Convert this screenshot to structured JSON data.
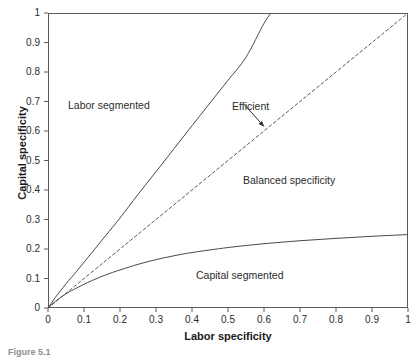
{
  "figure": {
    "caption": "Figure 5.1"
  },
  "axes": {
    "x_title": "Labor specificity",
    "y_title": "Capital specificity",
    "x_ticks": [
      "0",
      "0.1",
      "0.2",
      "0.3",
      "0.4",
      "0.5",
      "0.6",
      "0.7",
      "0.8",
      "0.9",
      "1"
    ],
    "y_ticks": [
      "0",
      "0.1",
      "0.2",
      "0.3",
      "0.4",
      "0.5",
      "0.6",
      "0.7",
      "0.8",
      "0.9",
      "1"
    ]
  },
  "annotations": {
    "labor_segmented": "Labor segmented",
    "balanced_specificity": "Balanced specificity",
    "capital_segmented": "Capital segmented",
    "efficient": "Efficient"
  },
  "colors": {
    "frame": "#5a5a5a",
    "curve": "#4a4a4a",
    "dashed": "#5a5a5a",
    "text": "#2b2b2b"
  },
  "chart_data": {
    "type": "line",
    "title": "",
    "xlabel": "Labor specificity",
    "ylabel": "Capital specificity",
    "xlim": [
      0,
      1
    ],
    "ylim": [
      0,
      1
    ],
    "grid": false,
    "legend": "none",
    "xticks": [
      0,
      0.1,
      0.2,
      0.3,
      0.4,
      0.5,
      0.6,
      0.7,
      0.8,
      0.9,
      1
    ],
    "yticks": [
      0,
      0.1,
      0.2,
      0.3,
      0.4,
      0.5,
      0.6,
      0.7,
      0.8,
      0.9,
      1
    ],
    "series": [
      {
        "name": "Upper boundary (labor segmented / balanced)",
        "style": "solid",
        "x": [
          0,
          0.02,
          0.05,
          0.08,
          0.12,
          0.16,
          0.2,
          0.25,
          0.3,
          0.35,
          0.4,
          0.45,
          0.5,
          0.55,
          0.6,
          0.62
        ],
        "y": [
          0,
          0.035,
          0.082,
          0.125,
          0.185,
          0.245,
          0.305,
          0.385,
          0.462,
          0.54,
          0.618,
          0.695,
          0.772,
          0.85,
          0.965,
          1.0
        ]
      },
      {
        "name": "Efficient (45-degree line)",
        "style": "dashed",
        "x": [
          0,
          1
        ],
        "y": [
          0,
          1
        ]
      },
      {
        "name": "Lower boundary (capital segmented / balanced)",
        "style": "solid",
        "x": [
          0,
          0.02,
          0.05,
          0.08,
          0.12,
          0.16,
          0.2,
          0.25,
          0.3,
          0.35,
          0.4,
          0.5,
          0.6,
          0.7,
          0.8,
          0.9,
          1.0
        ],
        "y": [
          0,
          0.022,
          0.048,
          0.068,
          0.092,
          0.112,
          0.129,
          0.148,
          0.164,
          0.177,
          0.188,
          0.205,
          0.218,
          0.228,
          0.236,
          0.243,
          0.249
        ]
      }
    ],
    "annotations": [
      {
        "text": "Labor segmented",
        "x": 0.09,
        "y": 0.71
      },
      {
        "text": "Balanced specificity",
        "x": 0.56,
        "y": 0.455
      },
      {
        "text": "Capital segmented",
        "x": 0.44,
        "y": 0.135
      },
      {
        "text": "Efficient",
        "x": 0.53,
        "y": 0.705,
        "arrow_to": {
          "x": 0.6,
          "y": 0.615
        }
      }
    ]
  }
}
